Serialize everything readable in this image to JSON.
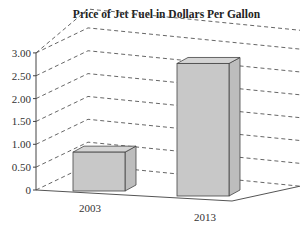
{
  "chart_data": {
    "type": "bar",
    "title": "Price of Jet Fuel in Dollars Per Gallon",
    "categories": [
      "2003",
      "2013"
    ],
    "values": [
      0.85,
      2.9
    ],
    "xlabel": "",
    "ylabel": "",
    "ylim": [
      0,
      3.0
    ],
    "yticks": [
      "0",
      "0.50",
      "1.00",
      "1.50",
      "2.00",
      "2.50",
      "3.00"
    ],
    "grid": true,
    "style": "3d",
    "bar_color": "#c8c8c8"
  }
}
